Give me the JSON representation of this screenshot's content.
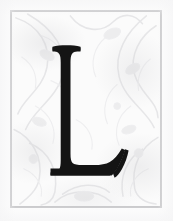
{
  "plate": {
    "kind": "illuminated-initial",
    "letter": "L",
    "caption": "Decorative drop-cap initial letter L on an ornamental ground",
    "width_px": "173",
    "height_px": "221"
  },
  "colors": {
    "page_background": "#fdfdfd",
    "panel_background": "#fbfbfb",
    "frame_rule": "#c9c9cb",
    "ornament_stroke": "#d6d6d9",
    "ornament_stroke_light": "#e4e4e7",
    "letter_fill": "#141414",
    "letter_shadow": "#2a2a2a"
  },
  "frame": {
    "label": "ornamental panel border",
    "left_px": "10",
    "top_px": "10",
    "width_px": "152",
    "height_px": "198",
    "rule_width_px": "2"
  },
  "ornament": {
    "label": "faint acanthus scrollwork background",
    "motif": "acanthus-scroll"
  },
  "initial": {
    "label": "initial capital letter",
    "character": "L",
    "typeface_style": "old-style serif",
    "cap_top_px": "47",
    "baseline_px": "174",
    "stem_left_px": "52",
    "arm_right_px": "120"
  }
}
